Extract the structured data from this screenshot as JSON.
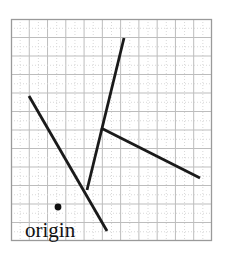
{
  "figure": {
    "background_color": "#ffffff",
    "width": 231,
    "height": 255
  },
  "grid": {
    "frame": {
      "x": 11,
      "y": 19,
      "width": 201,
      "height": 222
    },
    "border_color": "#9a9a9a",
    "major_line_color": "#bdbdbd",
    "minor_line_color": "#d8d8d8",
    "columns": 11,
    "rows": 12,
    "cell_width": 18.27,
    "cell_height": 18.5,
    "minor_dotted": true
  },
  "origin": {
    "label": "origin",
    "label_x": 25,
    "label_y": 237,
    "label_font_size": 21,
    "dot_x": 58,
    "dot_y": 207,
    "dot_radius": 3.4,
    "dot_color": "#111111"
  },
  "segments": [
    {
      "name": "upper-left-to-lower-right-long-segment",
      "x1": 29,
      "y1": 96,
      "x2": 107,
      "y2": 231,
      "color": "#1a1a1a",
      "width": 2.8
    },
    {
      "name": "steep-ascending-segment",
      "x1": 87,
      "y1": 190,
      "x2": 124,
      "y2": 38,
      "color": "#1a1a1a",
      "width": 2.8
    },
    {
      "name": "shallow-descending-segment",
      "x1": 101,
      "y1": 128,
      "x2": 200,
      "y2": 178,
      "color": "#1a1a1a",
      "width": 2.8
    }
  ]
}
